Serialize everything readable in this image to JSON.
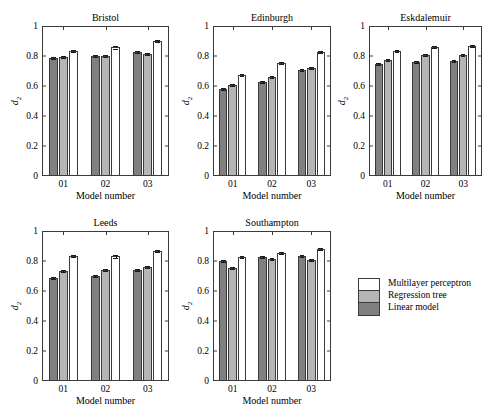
{
  "chart_data": {
    "type": "bar",
    "title": "",
    "xlabel": "Model number",
    "ylabel": "d2",
    "ylabel_base": "d",
    "ylabel_sub": "2",
    "categories": [
      "01",
      "02",
      "03"
    ],
    "ylim": [
      0,
      1
    ],
    "yticks": [
      "0",
      "0.2",
      "0.4",
      "0.6",
      "0.8",
      "1"
    ],
    "ytick_values": [
      0,
      0.2,
      0.4,
      0.6,
      0.8,
      1
    ],
    "grid": false,
    "legend_position": "bottom-right",
    "series_names": [
      "Linear model",
      "Regression tree",
      "Multilayer perceptron"
    ],
    "series_colors": [
      "#808080",
      "#b5b5b5",
      "#ffffff"
    ],
    "panels": [
      {
        "title": "Bristol",
        "series": [
          {
            "name": "Linear model",
            "values": [
              0.785,
              0.799,
              0.827
            ],
            "errors": [
              0.006,
              0.006,
              0.007
            ]
          },
          {
            "name": "Regression tree",
            "values": [
              0.793,
              0.799,
              0.811
            ],
            "errors": [
              0.006,
              0.006,
              0.006
            ]
          },
          {
            "name": "Multilayer perceptron",
            "values": [
              0.832,
              0.858,
              0.899
            ],
            "errors": [
              0.007,
              0.008,
              0.008
            ]
          }
        ]
      },
      {
        "title": "Edinburgh",
        "series": [
          {
            "name": "Linear model",
            "values": [
              0.578,
              0.628,
              0.706
            ],
            "errors": [
              0.007,
              0.007,
              0.007
            ]
          },
          {
            "name": "Regression tree",
            "values": [
              0.605,
              0.663,
              0.721
            ],
            "errors": [
              0.007,
              0.007,
              0.007
            ]
          },
          {
            "name": "Multilayer perceptron",
            "values": [
              0.672,
              0.752,
              0.827
            ],
            "errors": [
              0.008,
              0.008,
              0.008
            ]
          }
        ]
      },
      {
        "title": "Eskdalemuir",
        "series": [
          {
            "name": "Linear model",
            "values": [
              0.745,
              0.762,
              0.765
            ],
            "errors": [
              0.006,
              0.006,
              0.006
            ]
          },
          {
            "name": "Regression tree",
            "values": [
              0.772,
              0.805,
              0.808
            ],
            "errors": [
              0.006,
              0.007,
              0.007
            ]
          },
          {
            "name": "Multilayer perceptron",
            "values": [
              0.835,
              0.862,
              0.868
            ],
            "errors": [
              0.008,
              0.008,
              0.008
            ]
          }
        ]
      },
      {
        "title": "Leeds",
        "series": [
          {
            "name": "Linear model",
            "values": [
              0.688,
              0.702,
              0.738
            ],
            "errors": [
              0.006,
              0.006,
              0.006
            ]
          },
          {
            "name": "Regression tree",
            "values": [
              0.735,
              0.738,
              0.762
            ],
            "errors": [
              0.006,
              0.006,
              0.007
            ]
          },
          {
            "name": "Multilayer perceptron",
            "values": [
              0.832,
              0.831,
              0.868
            ],
            "errors": [
              0.008,
              0.008,
              0.008
            ]
          }
        ]
      },
      {
        "title": "Southampton",
        "series": [
          {
            "name": "Linear model",
            "values": [
              0.8,
              0.825,
              0.831
            ],
            "errors": [
              0.006,
              0.007,
              0.006
            ]
          },
          {
            "name": "Regression tree",
            "values": [
              0.755,
              0.815,
              0.806
            ],
            "errors": [
              0.006,
              0.008,
              0.007
            ]
          },
          {
            "name": "Multilayer perceptron",
            "values": [
              0.828,
              0.852,
              0.882
            ],
            "errors": [
              0.007,
              0.008,
              0.008
            ]
          }
        ]
      }
    ]
  },
  "legend": {
    "entries": [
      {
        "label": "Multilayer perceptron",
        "color": "#ffffff"
      },
      {
        "label": "Regression tree",
        "color": "#b5b5b5"
      },
      {
        "label": "Linear model",
        "color": "#808080"
      }
    ]
  }
}
